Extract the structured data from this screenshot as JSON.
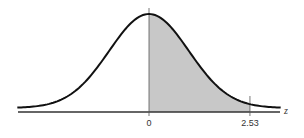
{
  "chart_data": {
    "type": "area",
    "title": "",
    "xlabel": "z",
    "ylabel": "",
    "xlim": [
      -3.3,
      3.3
    ],
    "distribution": {
      "name": "standard normal",
      "mean": 0,
      "sd": 1
    },
    "shaded_region": {
      "from": 0,
      "to": 2.53,
      "color": "#c8c8c8"
    },
    "tick_labels": [
      {
        "value": 0,
        "label": "0"
      },
      {
        "value": 2.53,
        "label": "2.53"
      }
    ],
    "grid": false,
    "legend": null
  },
  "labels": {
    "axis_variable": "z",
    "tick_zero": "0",
    "tick_upper": "2.53"
  },
  "colors": {
    "curve": "#111111",
    "axis": "#333333",
    "shade": "#c8c8c8"
  }
}
